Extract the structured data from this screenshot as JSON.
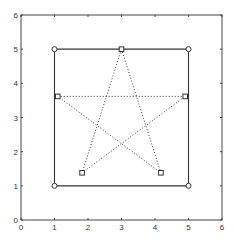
{
  "chart_data": {
    "type": "line",
    "title": "",
    "xlabel": "",
    "ylabel": "",
    "xlim": [
      0,
      6
    ],
    "ylim": [
      0,
      6
    ],
    "grid": false,
    "legend": null,
    "x_ticks": [
      0,
      1,
      2,
      3,
      4,
      5,
      6
    ],
    "y_ticks": [
      0,
      1,
      2,
      3,
      4,
      5,
      6
    ],
    "x_tick_labels": [
      "0",
      "1",
      "2",
      "3",
      "4",
      "5",
      "6"
    ],
    "y_tick_labels": [
      "0",
      "1",
      "2",
      "3",
      "4",
      "5",
      "6"
    ],
    "series": [
      {
        "name": "square",
        "style": "solid",
        "marker": "circle",
        "color": "#333333",
        "x": [
          1,
          5,
          5,
          1,
          1
        ],
        "y": [
          1,
          1,
          5,
          5,
          1
        ]
      },
      {
        "name": "pentagram",
        "style": "dotted",
        "marker": "square",
        "color": "#333333",
        "x": [
          3.0,
          4.176,
          1.098,
          4.902,
          1.824,
          3.0
        ],
        "y": [
          5.0,
          1.382,
          3.618,
          3.618,
          1.382,
          5.0
        ]
      }
    ]
  }
}
